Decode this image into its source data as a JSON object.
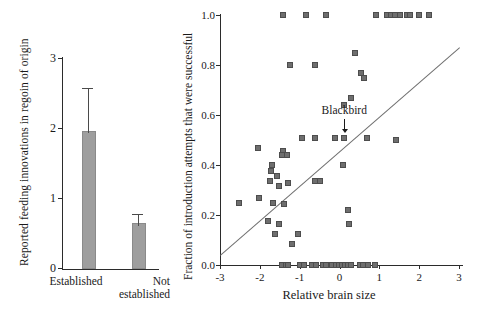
{
  "figure": {
    "background": "#ffffff",
    "bar_color": "#9e9e9e",
    "marker_color": "#6e6e6e",
    "axis_color": "#2b2b2b",
    "fit_line_color": "#6f6f6f"
  },
  "bar_panel": {
    "ylabel": "Reported feeding innovations in regoin of origin",
    "yticks": [
      "0",
      "1",
      "2",
      "3"
    ],
    "categories": [
      "Established",
      "Not established"
    ],
    "category_lines": [
      [
        "Established"
      ],
      [
        "Not",
        "established"
      ]
    ]
  },
  "scatter_panel": {
    "ylabel": "Fraction of introduction attempts that were successful",
    "xlabel": "Relative brain size",
    "yticks": [
      "0.0",
      "0.2",
      "0.4",
      "0.6",
      "0.8",
      "1.0"
    ],
    "xticks": [
      "-3",
      "-2",
      "-1",
      "0",
      "1",
      "2",
      "3"
    ],
    "annotation": {
      "label": "Blackbird",
      "x": 0.12,
      "y": 0.51
    }
  },
  "chart_data": [
    {
      "type": "bar",
      "title": "",
      "xlabel": "",
      "ylabel": "Reported feeding innovations in regoin of origin",
      "categories": [
        "Established",
        "Not established"
      ],
      "values": [
        1.93,
        0.62
      ],
      "errors_upper": [
        0.64,
        0.16
      ],
      "errors_lower": [
        0.0,
        0.0
      ],
      "ylim": [
        0,
        3
      ],
      "yticks": [
        0,
        1,
        2,
        3
      ],
      "grid": false,
      "legend": "none"
    },
    {
      "type": "scatter",
      "title": "",
      "xlabel": "Relative brain size",
      "ylabel": "Fraction of introduction attempts that were successful",
      "xlim": [
        -3,
        3
      ],
      "ylim": [
        0.0,
        1.0
      ],
      "xticks": [
        -3,
        -2,
        -1,
        0,
        1,
        2,
        3
      ],
      "yticks": [
        0.0,
        0.2,
        0.4,
        0.6,
        0.8,
        1.0
      ],
      "grid": false,
      "legend": "none",
      "annotations": [
        {
          "text": "Blackbird",
          "x": 0.12,
          "y": 0.51,
          "arrow": "down"
        }
      ],
      "fit_line": {
        "x": [
          -3,
          3
        ],
        "y": [
          0.04,
          0.87
        ]
      },
      "points": [
        [
          -1.42,
          1.0
        ],
        [
          -0.85,
          1.0
        ],
        [
          -0.35,
          1.0
        ],
        [
          0.92,
          1.0
        ],
        [
          1.18,
          1.0
        ],
        [
          1.3,
          1.0
        ],
        [
          1.4,
          1.0
        ],
        [
          1.52,
          1.0
        ],
        [
          1.7,
          1.0
        ],
        [
          1.78,
          1.0
        ],
        [
          2.0,
          1.0
        ],
        [
          2.25,
          1.0
        ],
        [
          0.4,
          0.85
        ],
        [
          -1.25,
          0.8
        ],
        [
          -0.62,
          0.8
        ],
        [
          0.55,
          0.77
        ],
        [
          0.62,
          0.75
        ],
        [
          0.3,
          0.67
        ],
        [
          0.12,
          0.64
        ],
        [
          -0.12,
          0.51
        ],
        [
          0.12,
          0.51
        ],
        [
          0.7,
          0.51
        ],
        [
          1.42,
          0.5
        ],
        [
          -0.95,
          0.51
        ],
        [
          -0.62,
          0.51
        ],
        [
          -2.05,
          0.47
        ],
        [
          -1.42,
          0.455
        ],
        [
          -1.45,
          0.44
        ],
        [
          -1.32,
          0.44
        ],
        [
          0.08,
          0.4
        ],
        [
          -1.7,
          0.4
        ],
        [
          -1.72,
          0.375
        ],
        [
          -1.58,
          0.355
        ],
        [
          -0.62,
          0.335
        ],
        [
          -0.5,
          0.335
        ],
        [
          -1.3,
          0.33
        ],
        [
          -1.75,
          0.335
        ],
        [
          -1.52,
          0.315
        ],
        [
          -2.02,
          0.27
        ],
        [
          -2.52,
          0.25
        ],
        [
          -1.68,
          0.25
        ],
        [
          -1.4,
          0.245
        ],
        [
          0.22,
          0.22
        ],
        [
          -1.8,
          0.175
        ],
        [
          -1.52,
          0.165
        ],
        [
          0.25,
          0.165
        ],
        [
          -1.62,
          0.125
        ],
        [
          -1.05,
          0.125
        ],
        [
          -1.18,
          0.085
        ],
        [
          -1.45,
          0.0
        ],
        [
          -1.35,
          0.0
        ],
        [
          -1.3,
          0.0
        ],
        [
          -0.98,
          0.0
        ],
        [
          -0.88,
          0.0
        ],
        [
          -0.7,
          0.0
        ],
        [
          -0.6,
          0.0
        ],
        [
          -0.42,
          0.0
        ],
        [
          -0.34,
          0.0
        ],
        [
          -0.18,
          0.0
        ],
        [
          -0.1,
          0.0
        ],
        [
          -0.02,
          0.0
        ],
        [
          0.06,
          0.0
        ],
        [
          0.14,
          0.0
        ],
        [
          0.22,
          0.0
        ],
        [
          0.3,
          0.0
        ],
        [
          0.52,
          0.0
        ],
        [
          0.6,
          0.0
        ],
        [
          0.72,
          0.0
        ],
        [
          0.88,
          0.0
        ]
      ]
    }
  ]
}
